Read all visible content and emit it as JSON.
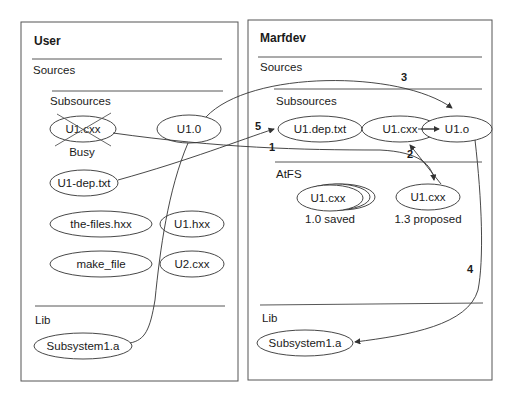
{
  "diagram": {
    "panels": [
      {
        "id": "user",
        "title": "User",
        "sections": {
          "sources": "Sources",
          "subsources": "Subsources",
          "lib": "Lib"
        },
        "nodes": {
          "u1cxx": "U1.cxx",
          "u1cxx_status": "Busy",
          "u10": "U1.0",
          "u1dep": "U1-dep.txt",
          "thefiles": "the-files.hxx",
          "u1hxx": "U1.hxx",
          "makefile": "make_file",
          "u2cxx": "U2.cxx",
          "subsystem": "Subsystem1.a"
        }
      },
      {
        "id": "marfdev",
        "title": "Marfdev",
        "sections": {
          "sources": "Sources",
          "subsources": "Subsources",
          "atfs": "AtFS",
          "lib": "Lib"
        },
        "nodes": {
          "u1deptxt": "U1.dep.txt",
          "u1cxx": "U1.cxx",
          "u1o": "U1.o",
          "atfs_saved": "U1.cxx",
          "atfs_saved_label": "1.0 saved",
          "atfs_proposed": "U1.cxx",
          "atfs_proposed_label": "1.3 proposed",
          "subsystem": "Subsystem1.a"
        }
      }
    ],
    "edges": [
      {
        "label": "1",
        "from": "User U1.cxx",
        "to": "AtFS U1.cxx (1.3 proposed)"
      },
      {
        "label": "2",
        "from": "AtFS U1.cxx (1.3 proposed)",
        "to": "Marfdev U1.cxx"
      },
      {
        "label": "3",
        "from": "User U1.0",
        "to": "Marfdev U1.o"
      },
      {
        "label": "4",
        "from": "Marfdev U1.o",
        "to": "Marfdev Subsystem1.a"
      },
      {
        "label": "5",
        "from": "User U1-dep.txt",
        "to": "Marfdev U1.dep.txt"
      }
    ]
  }
}
